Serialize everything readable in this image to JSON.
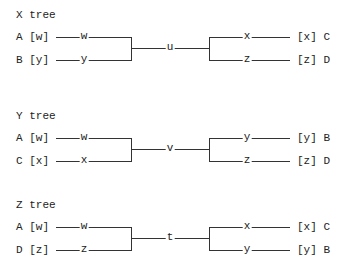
{
  "trees": [
    {
      "title": "X tree",
      "left_leaves": [
        {
          "label": "A [w]",
          "node": "w"
        },
        {
          "label": "B [y]",
          "node": "y"
        }
      ],
      "root": "u",
      "right_leaves": [
        {
          "label": "[x] C",
          "node": "x"
        },
        {
          "label": "[z] D",
          "node": "z"
        }
      ]
    },
    {
      "title": "Y tree",
      "left_leaves": [
        {
          "label": "A [w]",
          "node": "w"
        },
        {
          "label": "C [x]",
          "node": "x"
        }
      ],
      "root": "v",
      "right_leaves": [
        {
          "label": "[y] B",
          "node": "y"
        },
        {
          "label": "[z] D",
          "node": "z"
        }
      ]
    },
    {
      "title": "Z tree",
      "left_leaves": [
        {
          "label": "A [w]",
          "node": "w"
        },
        {
          "label": "D [z]",
          "node": "z"
        }
      ],
      "root": "t",
      "right_leaves": [
        {
          "label": "[x] C",
          "node": "x"
        },
        {
          "label": "[y] B",
          "node": "y"
        }
      ]
    }
  ]
}
